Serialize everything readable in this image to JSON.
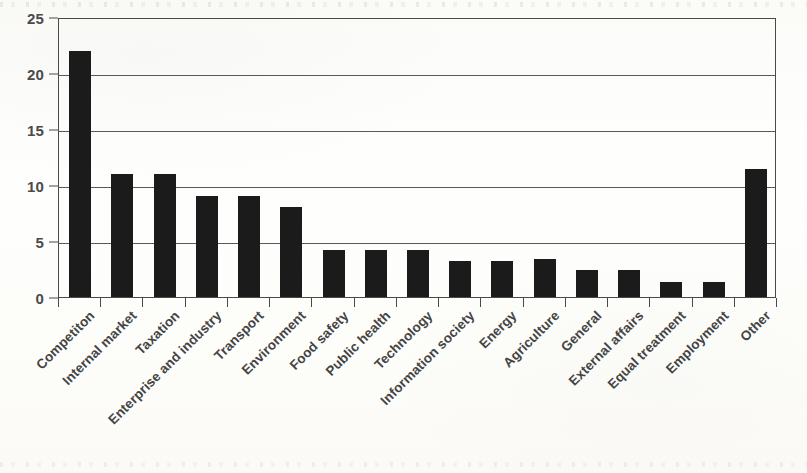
{
  "chart_data": {
    "type": "bar",
    "title": "",
    "subtitle": "",
    "xlabel": "",
    "ylabel": "",
    "ylim": [
      0,
      25
    ],
    "yticks": [
      0,
      5,
      10,
      15,
      20,
      25
    ],
    "grid": true,
    "gridlines_at": [
      5,
      10,
      15,
      20,
      25
    ],
    "legend": "none",
    "orientation": "vertical",
    "bar_color": "#1b1b1b",
    "xtick_label_rotation": -45,
    "categories": [
      "Competiton",
      "Internal market",
      "Taxation",
      "Enterprise and industry",
      "Transport",
      "Environment",
      "Food safety",
      "Public health",
      "Technology",
      "Information society",
      "Energy",
      "Agriculture",
      "General",
      "External affairs",
      "Equal treatment",
      "Employment",
      "Other"
    ],
    "values": [
      22,
      11,
      11,
      9,
      9,
      8,
      4.2,
      4.2,
      4.2,
      3.2,
      3.2,
      3.4,
      2.4,
      2.4,
      1.3,
      1.3,
      11.4
    ]
  },
  "axis": {
    "y_tick_labels": [
      "0",
      "5",
      "10",
      "15",
      "20",
      "25"
    ]
  }
}
